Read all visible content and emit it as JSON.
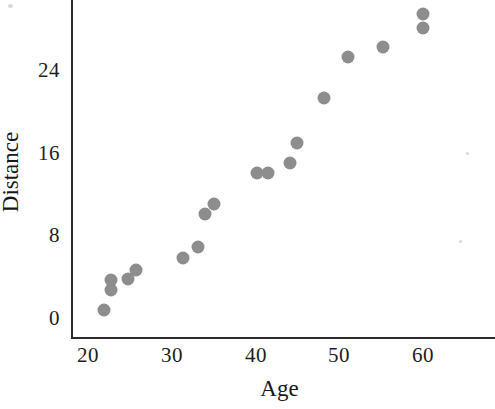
{
  "chart_data": {
    "type": "scatter",
    "title": "",
    "xlabel": "Age",
    "ylabel": "Distance",
    "xlim": [
      18,
      68
    ],
    "ylim": [
      -1.5,
      31
    ],
    "grid": false,
    "legend": null,
    "xticks": [
      20,
      30,
      40,
      50,
      60
    ],
    "yticks": [
      0,
      8,
      16,
      24
    ],
    "xtick_labels": [
      "20",
      "30",
      "40",
      "50",
      "60"
    ],
    "ytick_labels": [
      "0",
      "8",
      "16",
      "24"
    ],
    "marker": {
      "shape": "circle",
      "color": "#8d8d8d",
      "size_px": 13
    },
    "axis_color": "#2b2b2b",
    "background_color": "#ffffff",
    "points": [
      {
        "x": 21.9,
        "y": 0.8
      },
      {
        "x": 22.7,
        "y": 2.7
      },
      {
        "x": 22.7,
        "y": 3.7
      },
      {
        "x": 24.8,
        "y": 3.8
      },
      {
        "x": 25.7,
        "y": 4.6
      },
      {
        "x": 31.3,
        "y": 5.8
      },
      {
        "x": 33.1,
        "y": 6.9
      },
      {
        "x": 34.0,
        "y": 10.1
      },
      {
        "x": 35.0,
        "y": 11.0
      },
      {
        "x": 40.2,
        "y": 14.0
      },
      {
        "x": 41.5,
        "y": 14.0
      },
      {
        "x": 44.1,
        "y": 15.0
      },
      {
        "x": 45.0,
        "y": 16.9
      },
      {
        "x": 48.2,
        "y": 21.3
      },
      {
        "x": 51.0,
        "y": 25.3
      },
      {
        "x": 55.2,
        "y": 26.2
      },
      {
        "x": 60.0,
        "y": 28.1
      },
      {
        "x": 60.0,
        "y": 29.4
      }
    ],
    "x_series": [
      21.9,
      22.7,
      22.7,
      24.8,
      25.7,
      31.3,
      33.1,
      34.0,
      35.0,
      40.2,
      41.5,
      44.1,
      45.0,
      48.2,
      51.0,
      55.2,
      60.0,
      60.0
    ],
    "y_series": [
      0.8,
      2.7,
      3.7,
      3.8,
      4.6,
      5.8,
      6.9,
      10.1,
      11.0,
      14.0,
      14.0,
      15.0,
      16.9,
      21.3,
      25.3,
      26.2,
      28.1,
      29.4
    ]
  },
  "axes": {
    "x_title": "Age",
    "y_title": "Distance"
  }
}
